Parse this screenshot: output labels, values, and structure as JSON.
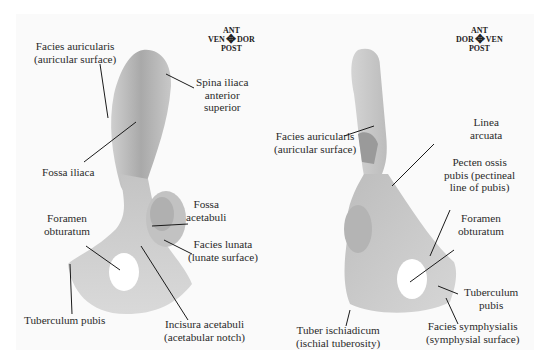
{
  "left_panel": {
    "compass": {
      "top": "ANT",
      "left": "VEN",
      "right": "DOR",
      "bottom": "POST"
    },
    "labels": {
      "facies_auricularis": [
        "Facies auricularis",
        "(auricular surface)"
      ],
      "spina_iliaca": [
        "Spina iliaca",
        "anterior",
        "superior"
      ],
      "fossa_iliaca": [
        "Fossa iliaca"
      ],
      "foramen_obturatum": [
        "Foramen",
        "obturatum"
      ],
      "fossa_acetabuli": [
        "Fossa",
        "acetabuli"
      ],
      "facies_lunata": [
        "Facies lunata",
        "(lunate surface)"
      ],
      "tuberculum_pubis": [
        "Tuberculum pubis"
      ],
      "incisura_acetabuli": [
        "Incisura acetabuli",
        "(acetabular notch)"
      ]
    }
  },
  "right_panel": {
    "compass": {
      "top": "ANT",
      "left": "DOR",
      "right": "VEN",
      "bottom": "POST"
    },
    "labels": {
      "facies_auricularis": [
        "Facies auricularis",
        "(auricular surface)"
      ],
      "linea_arcuata": [
        "Linea",
        "arcuata"
      ],
      "pecten_ossis_pubis": [
        "Pecten ossis",
        "pubis (pectineal",
        "line of pubis)"
      ],
      "foramen_obturatum": [
        "Foramen",
        "obturatum"
      ],
      "tuberculum_pubis": [
        "Tuberculum",
        "pubis"
      ],
      "tuber_ischiadicum": [
        "Tuber ischiadicum",
        "(ischial tuberosity)"
      ],
      "facies_symphysialis": [
        "Facies symphysialis",
        "(symphysial surface)"
      ]
    }
  },
  "colors": {
    "bone_light": "#d8d8d8",
    "bone_mid": "#bdbdbd",
    "bone_dark": "#8e8e8e",
    "leader": "#1a1a1a",
    "background": "#ffffff"
  }
}
